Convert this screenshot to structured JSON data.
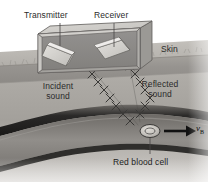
{
  "figure": {
    "title_alt": "Doppler ultrasound measurement of blood flow",
    "domain": "Natural-Image",
    "canvas": {
      "width": 208,
      "height": 182
    },
    "colors": {
      "page_background": "#ffffff",
      "tissue_upper": "#b9b6b1",
      "tissue_lower": "#a9a6a1",
      "skin_band": "#9c9894",
      "skin_band_edge": "#8a8681",
      "probe_top_face": "#cfcdc9",
      "probe_front_face": "#b4b2ae",
      "probe_side_face": "#9b9995",
      "probe_interior": "#8d8b87",
      "probe_outline": "#5f5d5a",
      "crystal_face": "#d8d6d2",
      "crystal_edge": "#6a6865",
      "vessel_wall": "#2b2a29",
      "vessel_lumen": "#8e8b87",
      "wave_stroke": "#3a3937",
      "leader_line": "#4a4846",
      "arrow": "#111111",
      "cell_fill": "#c9c6c1",
      "cell_stroke": "#3b3a38",
      "label_text": "#2b2b2b"
    }
  },
  "labels": {
    "transmitter": "Transmitter",
    "receiver": "Receiver",
    "skin": "Skin",
    "incident_sound_line1": "Incident",
    "incident_sound_line2": "sound",
    "reflected_sound_line1": "Reflected",
    "reflected_sound_line2": "sound",
    "red_blood_cell": "Red blood cell",
    "velocity_symbol": "v",
    "velocity_subscript": "B"
  },
  "elements": {
    "probe_label": "ultrasound-transducer-probe",
    "transmitter_crystal_label": "transmitter-crystal",
    "receiver_crystal_label": "receiver-crystal",
    "skin_surface_label": "skin-surface-band",
    "incident_wave_label": "incident-sound-wave",
    "reflected_wave_label": "reflected-sound-wave",
    "blood_vessel_label": "blood-vessel",
    "red_blood_cell_label": "red-blood-cell",
    "velocity_arrow_label": "blood-velocity-arrow"
  }
}
